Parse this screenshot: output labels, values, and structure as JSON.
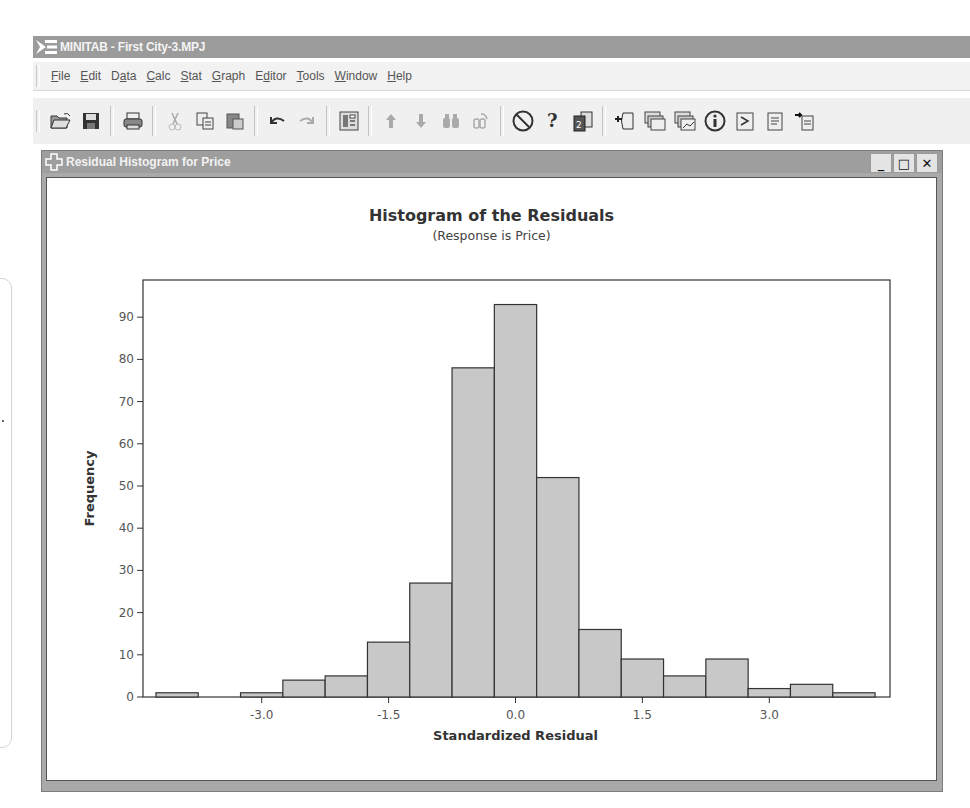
{
  "app": {
    "title": "MINITAB - First City-3.MPJ"
  },
  "menu": {
    "items": [
      {
        "label": "File",
        "accel": "F"
      },
      {
        "label": "Edit",
        "accel": "E"
      },
      {
        "label": "Data",
        "accel": "a"
      },
      {
        "label": "Calc",
        "accel": "C"
      },
      {
        "label": "Stat",
        "accel": "S"
      },
      {
        "label": "Graph",
        "accel": "G"
      },
      {
        "label": "Editor",
        "accel": "d"
      },
      {
        "label": "Tools",
        "accel": "T"
      },
      {
        "label": "Window",
        "accel": "W"
      },
      {
        "label": "Help",
        "accel": "H"
      }
    ]
  },
  "toolbar": {
    "groups": [
      [
        "open-icon",
        "save-icon"
      ],
      [
        "print-icon"
      ],
      [
        "cut-icon",
        "copy-icon",
        "paste-icon"
      ],
      [
        "undo-icon",
        "redo-icon"
      ],
      [
        "edit-last-dialog-icon"
      ],
      [
        "previous-icon",
        "next-icon",
        "find-icon",
        "replace-icon"
      ],
      [
        "cancel-icon",
        "help-icon",
        "stat-guide-icon"
      ],
      [
        "session-folder-icon",
        "graphs-folder-icon",
        "graph-folder-icon",
        "info-icon",
        "command-line-icon",
        "report-pad-icon",
        "append-report-icon"
      ]
    ]
  },
  "child_window": {
    "title": "Residual Histogram for Price",
    "controls": {
      "minimize": "_",
      "maximize": "□",
      "close": "✕"
    }
  },
  "chart_data": {
    "type": "bar",
    "title": "Histogram of the Residuals",
    "subtitle": "(Response is Price)",
    "xlabel": "Standardized Residual",
    "ylabel": "Frequency",
    "bin_width": 0.5,
    "bin_centers": [
      -4.0,
      -3.5,
      -3.0,
      -2.5,
      -2.0,
      -1.5,
      -1.0,
      -0.5,
      0.0,
      0.5,
      1.0,
      1.5,
      2.0,
      2.5,
      3.0,
      3.5,
      4.0
    ],
    "values": [
      1,
      0,
      1,
      4,
      5,
      13,
      27,
      78,
      93,
      52,
      16,
      9,
      5,
      9,
      2,
      3,
      1
    ],
    "x_ticks": [
      -3.0,
      -1.5,
      0.0,
      1.5,
      3.0
    ],
    "x_tick_labels": [
      "-3.0",
      "-1.5",
      "0.0",
      "1.5",
      "3.0"
    ],
    "y_ticks": [
      0,
      10,
      20,
      30,
      40,
      50,
      60,
      70,
      80,
      90
    ],
    "xlim": [
      -4.34,
      4.46
    ],
    "ylim": [
      0,
      98
    ],
    "grid": false,
    "bar_color": "#c8c8c8",
    "bar_edge_color": "#333333"
  }
}
